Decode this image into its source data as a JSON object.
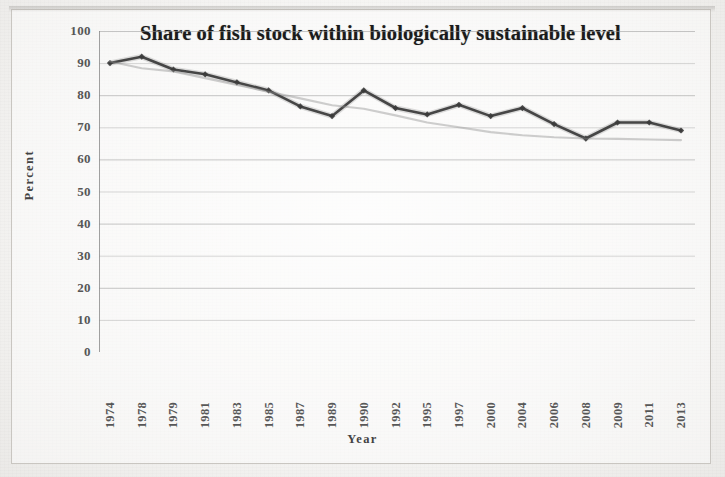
{
  "document": {
    "kind": "scanned-figure",
    "background_color": "#f3f2f0",
    "frame_color": "#c9c6c1"
  },
  "axis_titles": {
    "y": "Percent",
    "x": "Year"
  },
  "chart_data": {
    "type": "line",
    "title": "Share of fish stock within biologically sustainable level",
    "xlabel": "Year",
    "ylabel": "Percent",
    "ylim": [
      0,
      100
    ],
    "ytick_step": 10,
    "ytick_labels": [
      "0",
      "10",
      "20",
      "30",
      "40",
      "50",
      "60",
      "70",
      "80",
      "90",
      "100"
    ],
    "grid": true,
    "legend": false,
    "legend_position": "none",
    "categories": [
      "1974",
      "1978",
      "1979",
      "1981",
      "1983",
      "1985",
      "1987",
      "1989",
      "1990",
      "1992",
      "1995",
      "1997",
      "2000",
      "2004",
      "2006",
      "2008",
      "2009",
      "2011",
      "2013"
    ],
    "series": [
      {
        "name": "Share of fish stock within biologically sustainable level",
        "color": "#3a3a3a",
        "marker": "diamond",
        "values": [
          90,
          92,
          88,
          86.5,
          84,
          81.5,
          76.5,
          73.5,
          81.5,
          76,
          74,
          77,
          73.5,
          76,
          71,
          66.5,
          71.5,
          71.5,
          69
        ]
      },
      {
        "name": "Linear trend",
        "color": "#8d8d8d",
        "marker": "none",
        "trendline": true,
        "values": [
          90.5,
          88.4,
          87.4,
          85.3,
          83.2,
          81.1,
          79.0,
          76.9,
          75.8,
          73.7,
          71.5,
          70.0,
          68.5,
          67.5,
          66.9,
          66.5,
          66.4,
          66.2,
          66.0
        ]
      }
    ]
  }
}
